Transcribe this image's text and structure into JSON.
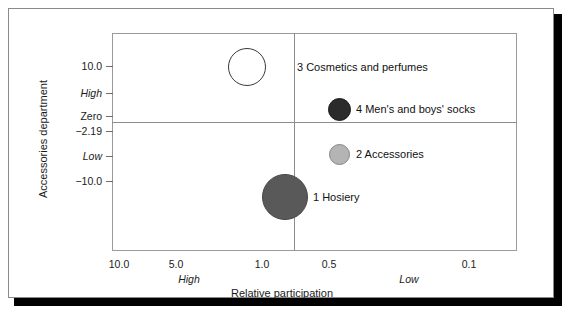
{
  "chart_data": {
    "type": "scatter",
    "title": "",
    "xlabel": "Relative participation",
    "ylabel": "Accessories department",
    "x_sub_low_label": "Low",
    "x_sub_high_label": "High",
    "y_ticks": [
      "10.0",
      "High",
      "Zero",
      "−2.19",
      "Low",
      "−10.0"
    ],
    "x_ticks": [
      "10.0",
      "5.0",
      "1.0",
      "0.5",
      "0.1"
    ],
    "grid": false,
    "legend": "inline-labels",
    "reference_lines": {
      "horizontal_value": "Zero",
      "vertical_value": "0.75"
    },
    "points": [
      {
        "id": "1",
        "label": "1 Hosiery",
        "x": 0.75,
        "y": -13.5,
        "size": 23,
        "color": "#595959",
        "outline": "#3f3f3f"
      },
      {
        "id": "2",
        "label": "2 Accessories",
        "x": 0.47,
        "y": -6.5,
        "size": 10,
        "color": "#b3b3b3",
        "outline": "#7a7a7a"
      },
      {
        "id": "3",
        "label": "3 Cosmetics and perfumes",
        "x": 1.05,
        "y": 11.5,
        "size": 19,
        "color": "#ffffff",
        "outline": "#333333"
      },
      {
        "id": "4",
        "label": "4 Men's and boys' socks",
        "x": 0.47,
        "y": 1.8,
        "size": 11,
        "color": "#2b2b2b",
        "outline": "#1a1a1a"
      }
    ]
  },
  "chart": {
    "y_axis": {
      "title": "Accessories department",
      "ticks": [
        {
          "label": "10.0",
          "italic": false,
          "top": 52
        },
        {
          "label": "High",
          "italic": true,
          "top": 79
        },
        {
          "label": "Zero",
          "italic": false,
          "top": 102
        },
        {
          "label": "−2.19",
          "italic": false,
          "top": 117
        },
        {
          "label": "Low",
          "italic": true,
          "top": 142
        },
        {
          "label": "−10.0",
          "italic": false,
          "top": 167
        }
      ]
    },
    "x_axis": {
      "title": "Relative participation",
      "ticks": [
        {
          "label": "10.0",
          "left": 110
        },
        {
          "label": "5.0",
          "left": 167
        },
        {
          "label": "1.0",
          "left": 253
        },
        {
          "label": "0.5",
          "left": 320
        },
        {
          "label": "0.1",
          "left": 460
        }
      ],
      "sub_labels": [
        {
          "label": "High",
          "left": 180
        },
        {
          "label": "Low",
          "left": 400
        }
      ]
    },
    "bubbles": [
      {
        "name": "hosiery",
        "label": "1 Hosiery",
        "cx": 276,
        "cy": 188,
        "r": 23,
        "fill": "#595959",
        "stroke": "#454545",
        "label_left": 304,
        "label_top": 182
      },
      {
        "name": "accessories",
        "label": "2 Accessories",
        "cx": 330,
        "cy": 145,
        "r": 10.5,
        "fill": "#b4b4b4",
        "stroke": "#858585",
        "label_left": 347,
        "label_top": 139
      },
      {
        "name": "cosmetics-and-perfumes",
        "label": "3 Cosmetics and perfumes",
        "cx": 238,
        "cy": 58,
        "r": 19,
        "fill": "#ffffff",
        "stroke": "#3a3a3a",
        "label_left": 288,
        "label_top": 52
      },
      {
        "name": "mens-and-boys-socks",
        "label": "4 Men's and boys' socks",
        "cx": 330,
        "cy": 100,
        "r": 11.5,
        "fill": "#2b2b2b",
        "stroke": "#1c1c1c",
        "label_left": 347,
        "label_top": 94
      }
    ]
  },
  "colors": {
    "frame": "#9a9a9a",
    "reference_line": "#8d8d8d",
    "card_border": "#8a8a8a",
    "shadow": "#000000",
    "text": "#1b1b1b"
  }
}
